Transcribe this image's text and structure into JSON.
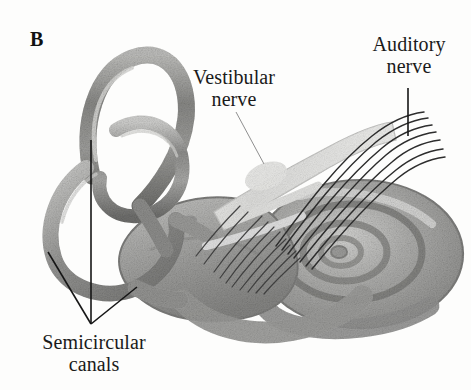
{
  "figure": {
    "panel_letter": "B",
    "background_color": "#fdfdfc",
    "ink_color": "#1a1a1a"
  },
  "labels": {
    "vestibular_nerve": "Vestibular\nnerve",
    "auditory_nerve": "Auditory\nnerve",
    "semicircular_canals": "Semicircular\ncanals"
  },
  "leaders": {
    "vestibular": {
      "from_x": 236,
      "from_y": 112,
      "to_x": 264,
      "to_y": 164,
      "color": "#8f8f8f"
    },
    "auditory": {
      "from_x": 408,
      "from_y": 88,
      "to_x": 408,
      "to_y": 136,
      "color": "#161616"
    },
    "semicircular": {
      "junction_x": 91,
      "junction_y": 324,
      "tips": [
        {
          "x": 48,
          "y": 252
        },
        {
          "x": 91,
          "y": 140
        },
        {
          "x": 137,
          "y": 287
        }
      ],
      "color": "#161616"
    }
  },
  "structures": [
    {
      "name": "superior-semicircular-canal",
      "tone": "#9a9a99"
    },
    {
      "name": "posterior-semicircular-canal",
      "tone": "#9f9f9e"
    },
    {
      "name": "horizontal-semicircular-canal",
      "tone": "#a3a3a2"
    },
    {
      "name": "vestibule",
      "tone": "#a8a8a6"
    },
    {
      "name": "cochlea",
      "tone": "#a6a6a4"
    },
    {
      "name": "vestibular-nerve-trunk",
      "tone": "#d8d8d6"
    },
    {
      "name": "auditory-nerve-fibers",
      "tone": "#2b2b2b"
    }
  ]
}
